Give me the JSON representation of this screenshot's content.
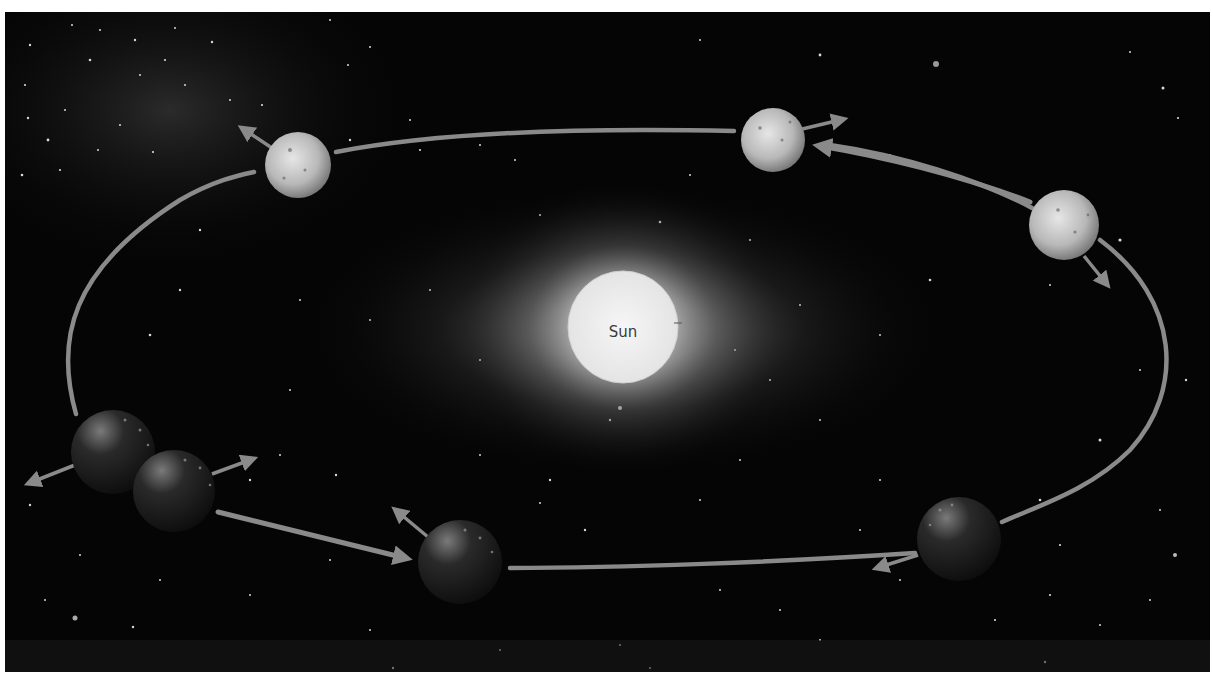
{
  "diagram": {
    "title": "",
    "type": "elliptical-orbit",
    "sun": {
      "label": "Sun",
      "cx": 623,
      "cy": 327,
      "r": 56
    },
    "orbit": {
      "cx": 622,
      "cy": 348,
      "rx": 556,
      "ry": 222,
      "color": "#8a8a8a"
    },
    "planets": [
      {
        "id": "p1",
        "cx": 298,
        "cy": 165,
        "r": 33,
        "shade": "light",
        "velocity_arrow": "up-left"
      },
      {
        "id": "p2",
        "cx": 773,
        "cy": 140,
        "r": 32,
        "shade": "light",
        "velocity_arrow": "right"
      },
      {
        "id": "p3",
        "cx": 1064,
        "cy": 225,
        "r": 35,
        "shade": "light",
        "velocity_arrow": "down-right"
      },
      {
        "id": "p4",
        "cx": 113,
        "cy": 452,
        "r": 42,
        "shade": "dark",
        "velocity_arrow": "left"
      },
      {
        "id": "p5",
        "cx": 174,
        "cy": 491,
        "r": 41,
        "shade": "dark",
        "velocity_arrow": "right"
      },
      {
        "id": "p6",
        "cx": 460,
        "cy": 562,
        "r": 42,
        "shade": "dark",
        "velocity_arrow": "up-left"
      },
      {
        "id": "p7",
        "cx": 959,
        "cy": 539,
        "r": 42,
        "shade": "dark",
        "velocity_arrow": "left"
      }
    ],
    "colors": {
      "space": "#050505",
      "orbit": "#8a8a8a",
      "sun": "#f2f2f2",
      "glow": "#ffffff"
    }
  }
}
